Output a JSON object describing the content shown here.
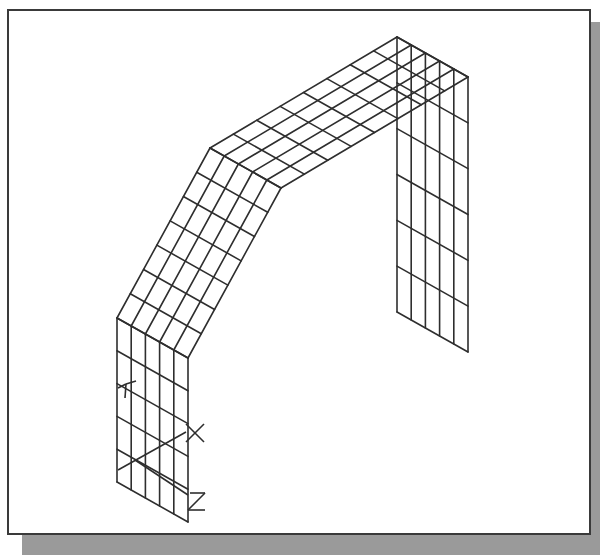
{
  "figure": {
    "colors": {
      "line": "#2e2e2e",
      "frame_border": "#3a3a3a",
      "shadow": "#9a9a9a",
      "background": "#ffffff"
    }
  },
  "mesh": {
    "width_divisions": 5,
    "path_front": [
      [
        117,
        482
      ],
      [
        117,
        318
      ],
      [
        210,
        148
      ],
      [
        397,
        37
      ],
      [
        397,
        312
      ]
    ],
    "width_offset": [
      71,
      40
    ],
    "segment_divisions": [
      5,
      7,
      8,
      6
    ]
  },
  "triad": {
    "axes": [
      {
        "label": "Y",
        "glyph": "Y"
      },
      {
        "label": "X",
        "glyph": "X"
      },
      {
        "label": "Z",
        "glyph": "Z"
      }
    ]
  }
}
